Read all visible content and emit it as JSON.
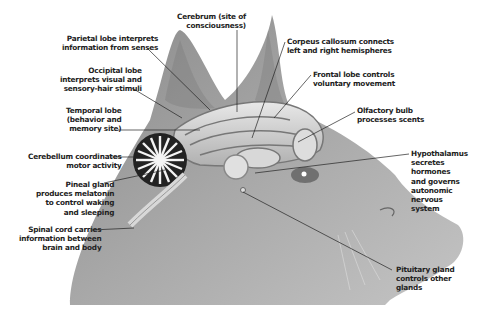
{
  "diagram": {
    "labels": [
      {
        "id": "cerebrum",
        "text": "Cerebrum (site of\nconsciousness)"
      },
      {
        "id": "parietal",
        "text": "Parietal lobe interprets\ninformation from senses"
      },
      {
        "id": "occipital",
        "text": "Occipital lobe\ninterprets visual and\nsensory-hair stimuli"
      },
      {
        "id": "temporal",
        "text": "Temporal lobe\n(behavior and\nmemory site)"
      },
      {
        "id": "cerebellum",
        "text": "Cerebellum coordinates\nmotor activity"
      },
      {
        "id": "pineal",
        "text": "Pineal gland\nproduces melatonin\nto control waking\nand sleeping"
      },
      {
        "id": "spinal",
        "text": "Spinal cord carries\ninformation between\nbrain and body"
      },
      {
        "id": "corpus",
        "text": "Corpeus callosum connects\nleft and right hemispheres"
      },
      {
        "id": "frontal",
        "text": "Frontal lobe controls\nvoluntary movement"
      },
      {
        "id": "olfactory",
        "text": "Olfactory bulb\nprocesses scents"
      },
      {
        "id": "hypothalamus",
        "text": "Hypothalamus\nsecretes\nhormones\nand governs\nautonomic\nnervous\nsystem"
      },
      {
        "id": "pituitary",
        "text": "Pituitary gland\ncontrols other\nglands"
      }
    ]
  }
}
